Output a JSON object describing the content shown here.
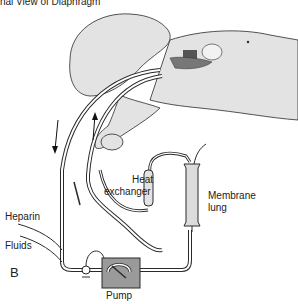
{
  "figure": {
    "caption": "nal View of Diaphragm",
    "panel_letter": "B",
    "labels": {
      "heparin": "Heparin",
      "fluids": "Fluids",
      "heat_exchanger_line1": "Heat",
      "heat_exchanger_line2": "exchanger",
      "membrane_lung_line1": "Membrane",
      "membrane_lung_line2": "lung",
      "pump": "Pump"
    },
    "colors": {
      "skin": "#e3e3e3",
      "outline": "#2a2a2a",
      "tubing": "#ffffff",
      "pump_body": "#9a9a9a",
      "lung_body": "#dcdcdc",
      "surgical_site": "#555555"
    }
  }
}
